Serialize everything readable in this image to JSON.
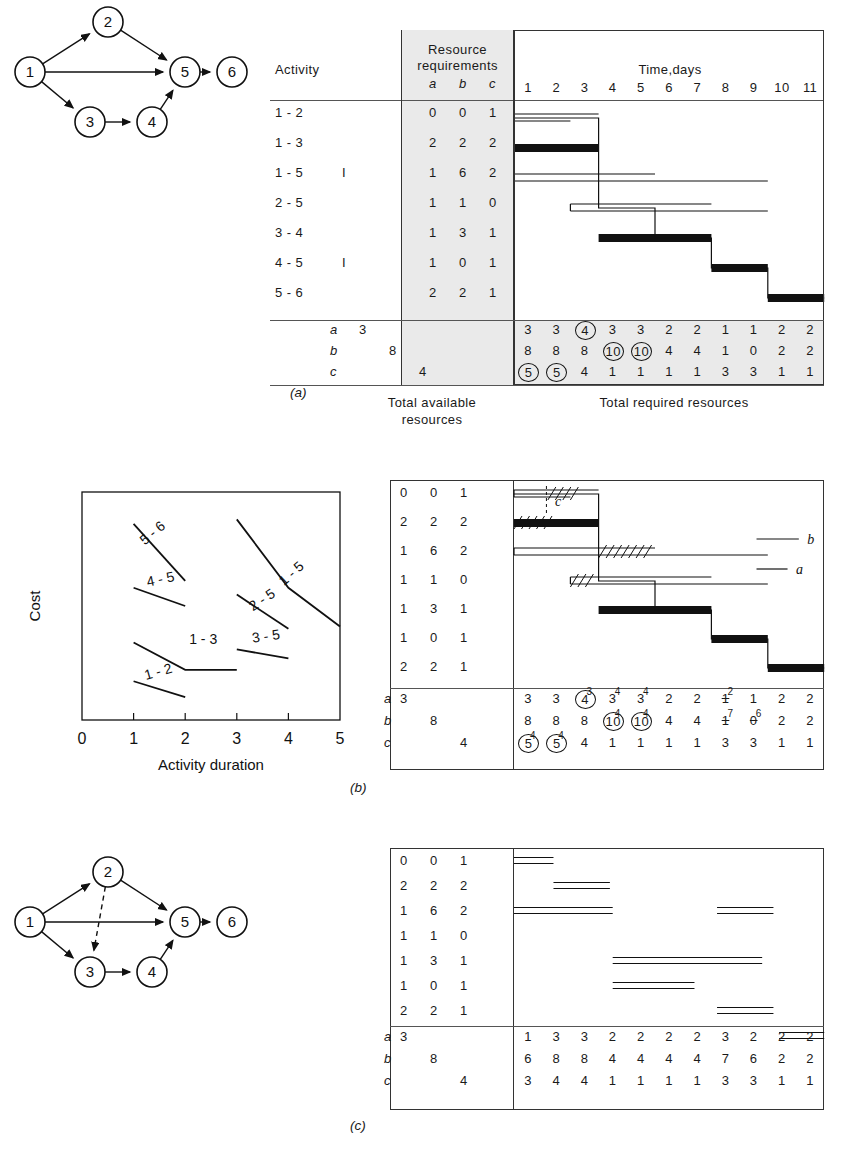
{
  "figure": {
    "domain": "resource-leveling-cpm-figure",
    "panels": [
      "(a)",
      "(b)",
      "(c)"
    ]
  },
  "headers": {
    "activity": "Activity",
    "resource_requirements": "Resource",
    "resource_requirements2": "requirements",
    "time_axis_title": "Time,days",
    "resource_cols": [
      "a",
      "b",
      "c"
    ],
    "total_available": "Total available",
    "total_available2": "resources",
    "total_required": "Total required resources"
  },
  "time_ticks": [
    "1",
    "2",
    "3",
    "4",
    "5",
    "6",
    "7",
    "8",
    "9",
    "10",
    "11"
  ],
  "activities": [
    {
      "name": "1 - 2",
      "flag": "",
      "a": "0",
      "b": "0",
      "c": "1"
    },
    {
      "name": "1 - 3",
      "flag": "",
      "a": "2",
      "b": "2",
      "c": "2"
    },
    {
      "name": "1 - 5",
      "flag": "I",
      "a": "1",
      "b": "6",
      "c": "2"
    },
    {
      "name": "2 - 5",
      "flag": "",
      "a": "1",
      "b": "1",
      "c": "0"
    },
    {
      "name": "3 - 4",
      "flag": "",
      "a": "1",
      "b": "3",
      "c": "1"
    },
    {
      "name": "4 - 5",
      "flag": "I",
      "a": "1",
      "b": "0",
      "c": "1"
    },
    {
      "name": "5 - 6",
      "flag": "",
      "a": "2",
      "b": "2",
      "c": "1"
    }
  ],
  "available": {
    "a": "3",
    "b": "8",
    "c": "4"
  },
  "row_labels": {
    "a": "a",
    "b": "b",
    "c": "c"
  },
  "panel_a": {
    "caption": "(a)",
    "required": {
      "a": [
        "3",
        "3",
        "4",
        "3",
        "3",
        "2",
        "2",
        "1",
        "1",
        "2",
        "2"
      ],
      "b": [
        "8",
        "8",
        "8",
        "10",
        "10",
        "4",
        "4",
        "1",
        "0",
        "2",
        "2"
      ],
      "c": [
        "5",
        "5",
        "4",
        "1",
        "1",
        "1",
        "1",
        "3",
        "3",
        "1",
        "1"
      ]
    },
    "circled": {
      "a": [
        false,
        false,
        true,
        false,
        false,
        false,
        false,
        false,
        false,
        false,
        false
      ],
      "b": [
        false,
        false,
        false,
        true,
        true,
        false,
        false,
        false,
        false,
        false,
        false
      ],
      "c": [
        true,
        true,
        false,
        false,
        false,
        false,
        false,
        false,
        false,
        false,
        false
      ]
    },
    "bars": [
      {
        "activity": "1 - 2",
        "start": 0,
        "end": 2,
        "critical": false,
        "float_end": 3
      },
      {
        "activity": "1 - 3",
        "start": 0,
        "end": 3,
        "critical": true,
        "float_end": 3
      },
      {
        "activity": "1 - 5",
        "start": 0,
        "end": 9,
        "critical": false,
        "float_end": 5
      },
      {
        "activity": "2 - 5",
        "start": 2,
        "end": 9,
        "critical": false,
        "float_end": 7
      },
      {
        "activity": "3 - 4",
        "start": 3,
        "end": 7,
        "critical": true,
        "float_end": 7
      },
      {
        "activity": "4 - 5",
        "start": 7,
        "end": 9,
        "critical": true,
        "float_end": 9
      },
      {
        "activity": "5 - 6",
        "start": 9,
        "end": 11,
        "critical": true,
        "float_end": 11
      }
    ]
  },
  "panel_b": {
    "caption": "(b)",
    "resource_labels": {
      "a": "a",
      "b": "b",
      "c": "c"
    },
    "required": {
      "a": [
        "3",
        "3",
        "4",
        "3",
        "3",
        "2",
        "2",
        "1",
        "1",
        "2",
        "2"
      ],
      "b": [
        "8",
        "8",
        "8",
        "10",
        "10",
        "4",
        "4",
        "1",
        "0",
        "2",
        "2"
      ],
      "c": [
        "5",
        "5",
        "4",
        "1",
        "1",
        "1",
        "1",
        "3",
        "3",
        "1",
        "1"
      ]
    },
    "circled": {
      "a": [
        false,
        false,
        true,
        false,
        false,
        false,
        false,
        false,
        false,
        false,
        false
      ],
      "b": [
        false,
        false,
        false,
        true,
        true,
        false,
        false,
        false,
        false,
        false,
        false
      ],
      "c": [
        true,
        true,
        false,
        false,
        false,
        false,
        false,
        false,
        false,
        false,
        false
      ]
    },
    "struck": {
      "a": [
        false,
        false,
        false,
        false,
        false,
        false,
        false,
        true,
        false,
        false,
        false
      ],
      "b": [
        false,
        false,
        false,
        false,
        false,
        false,
        false,
        true,
        true,
        false,
        false
      ],
      "c": [
        false,
        false,
        false,
        false,
        false,
        false,
        false,
        false,
        false,
        false,
        false
      ]
    },
    "superscripts": {
      "a": [
        "",
        "",
        "3",
        "4",
        "4",
        "",
        "",
        "2",
        "",
        "",
        ""
      ],
      "b": [
        "",
        "",
        "",
        "4",
        "4",
        "",
        "",
        "7",
        "6",
        "",
        ""
      ],
      "c": [
        "4",
        "4",
        "",
        "",
        "",
        "",
        "",
        "",
        "",
        "",
        ""
      ]
    },
    "bars": [
      {
        "activity": "1 - 2",
        "start": 0,
        "end": 2,
        "critical": false,
        "float_end": 3,
        "hatch_start": 1.2,
        "hatch_end": 2
      },
      {
        "activity": "1 - 3",
        "start": 0,
        "end": 3,
        "critical": true,
        "float_end": 3,
        "hatch_start": 0,
        "hatch_end": 1.1
      },
      {
        "activity": "1 - 5",
        "start": 0,
        "end": 9,
        "critical": false,
        "float_end": 5,
        "hatch_start": 3,
        "hatch_end": 4.6
      },
      {
        "activity": "2 - 5",
        "start": 2,
        "end": 9,
        "critical": false,
        "float_end": 7,
        "hatch_start": 2,
        "hatch_end": 2.7
      },
      {
        "activity": "3 - 4",
        "start": 3,
        "end": 7,
        "critical": true,
        "float_end": 7
      },
      {
        "activity": "4 - 5",
        "start": 7,
        "end": 9,
        "critical": true,
        "float_end": 9
      },
      {
        "activity": "5 - 6",
        "start": 9,
        "end": 11,
        "critical": true,
        "float_end": 11
      }
    ],
    "annotations": [
      {
        "label": "b",
        "row": 2
      },
      {
        "label": "a",
        "row": 3
      },
      {
        "label": "c",
        "row": 0
      }
    ]
  },
  "panel_c": {
    "caption": "(c)",
    "required": {
      "a": [
        "1",
        "3",
        "3",
        "2",
        "2",
        "2",
        "2",
        "3",
        "2",
        "2",
        "2"
      ],
      "b": [
        "6",
        "8",
        "8",
        "4",
        "4",
        "4",
        "4",
        "7",
        "6",
        "2",
        "2"
      ],
      "c": [
        "3",
        "4",
        "4",
        "1",
        "1",
        "1",
        "1",
        "3",
        "3",
        "1",
        "1"
      ]
    },
    "bars": [
      {
        "activity": "1 - 2",
        "start": 0,
        "end": 1.4
      },
      {
        "activity": "1 - 3",
        "start": 1.4,
        "end": 3.4
      },
      {
        "activity": "1 - 5",
        "start": 0,
        "end": 3.5
      },
      {
        "activity": "1 - 5b",
        "start": 7.2,
        "end": 9.2
      },
      {
        "activity": "2 - 5",
        "start": 3.5,
        "end": 8.8
      },
      {
        "activity": "3 - 4",
        "start": 3.5,
        "end": 6.4
      },
      {
        "activity": "4 - 5",
        "start": 7.2,
        "end": 9.2
      },
      {
        "activity": "5 - 6",
        "start": 9.4,
        "end": 11
      }
    ]
  },
  "cost_chart": {
    "type": "line",
    "title": "",
    "xlabel": "Activity duration",
    "ylabel": "Cost",
    "xticks": [
      "0",
      "1",
      "2",
      "3",
      "4",
      "5"
    ],
    "xlim": [
      0,
      5
    ],
    "grid": false,
    "series": [
      {
        "name": "5 - 6",
        "x": [
          1,
          2
        ],
        "y": [
          0.86,
          0.61
        ]
      },
      {
        "name": "4 - 5",
        "x": [
          1,
          2
        ],
        "y": [
          0.58,
          0.5
        ]
      },
      {
        "name": "1 - 5",
        "x": [
          3,
          4,
          5
        ],
        "y": [
          0.88,
          0.58,
          0.41
        ]
      },
      {
        "name": "2 - 5",
        "x": [
          3,
          4
        ],
        "y": [
          0.55,
          0.4
        ]
      },
      {
        "name": "3 - 5",
        "x": [
          3,
          4
        ],
        "y": [
          0.31,
          0.27
        ]
      },
      {
        "name": "1 - 3",
        "x": [
          1,
          2,
          3
        ],
        "y": [
          0.34,
          0.22,
          0.22
        ]
      },
      {
        "name": "1 - 2",
        "x": [
          1,
          2
        ],
        "y": [
          0.17,
          0.1
        ]
      }
    ]
  },
  "network_a": {
    "nodes": [
      {
        "id": "1",
        "x": 30,
        "y": 72
      },
      {
        "id": "2",
        "x": 108,
        "y": 22
      },
      {
        "id": "3",
        "x": 90,
        "y": 122
      },
      {
        "id": "4",
        "x": 152,
        "y": 122
      },
      {
        "id": "5",
        "x": 185,
        "y": 72
      },
      {
        "id": "6",
        "x": 232,
        "y": 72
      }
    ],
    "edges": [
      {
        "from": "1",
        "to": "2",
        "dashed": false
      },
      {
        "from": "1",
        "to": "5",
        "dashed": false
      },
      {
        "from": "1",
        "to": "3",
        "dashed": false
      },
      {
        "from": "2",
        "to": "5",
        "dashed": false
      },
      {
        "from": "3",
        "to": "4",
        "dashed": false
      },
      {
        "from": "4",
        "to": "5",
        "dashed": false
      },
      {
        "from": "5",
        "to": "6",
        "dashed": false
      }
    ]
  },
  "network_c": {
    "nodes": [
      {
        "id": "1",
        "x": 30,
        "y": 72
      },
      {
        "id": "2",
        "x": 108,
        "y": 22
      },
      {
        "id": "3",
        "x": 90,
        "y": 122
      },
      {
        "id": "4",
        "x": 152,
        "y": 122
      },
      {
        "id": "5",
        "x": 185,
        "y": 72
      },
      {
        "id": "6",
        "x": 232,
        "y": 72
      }
    ],
    "edges": [
      {
        "from": "1",
        "to": "2",
        "dashed": false
      },
      {
        "from": "1",
        "to": "5",
        "dashed": false
      },
      {
        "from": "1",
        "to": "3",
        "dashed": false
      },
      {
        "from": "2",
        "to": "5",
        "dashed": false
      },
      {
        "from": "2",
        "to": "3",
        "dashed": true
      },
      {
        "from": "3",
        "to": "4",
        "dashed": false
      },
      {
        "from": "4",
        "to": "5",
        "dashed": false
      },
      {
        "from": "5",
        "to": "6",
        "dashed": false
      }
    ]
  }
}
